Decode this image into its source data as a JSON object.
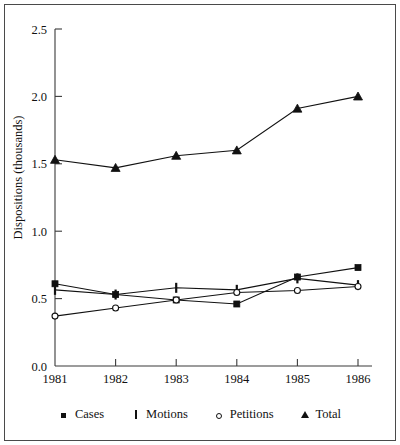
{
  "chart_data": {
    "type": "line",
    "title": "",
    "xlabel": "",
    "ylabel": "Dispositions (thousands)",
    "categories": [
      "1981",
      "1982",
      "1983",
      "1984",
      "1985",
      "1986"
    ],
    "x": [
      1981,
      1982,
      1983,
      1984,
      1985,
      1986
    ],
    "ylim": [
      0.0,
      2.5
    ],
    "yticks": [
      "0.0",
      "0.5",
      "1.0",
      "1.5",
      "2.0",
      "2.5"
    ],
    "ytick_values": [
      0.0,
      0.5,
      1.0,
      1.5,
      2.0,
      2.5
    ],
    "grid": false,
    "legend_position": "bottom",
    "series": [
      {
        "name": "Cases",
        "marker": "filled-square",
        "values": [
          0.61,
          0.53,
          0.49,
          0.46,
          0.66,
          0.73
        ]
      },
      {
        "name": "Motions",
        "marker": "vertical-bar",
        "values": [
          0.565,
          0.53,
          0.58,
          0.565,
          0.65,
          0.6
        ]
      },
      {
        "name": "Petitions",
        "marker": "open-circle",
        "values": [
          0.37,
          0.43,
          0.49,
          0.545,
          0.56,
          0.59
        ]
      },
      {
        "name": "Total",
        "marker": "filled-triangle",
        "values": [
          1.53,
          1.47,
          1.56,
          1.6,
          1.91,
          2.0
        ]
      }
    ]
  },
  "legend": {
    "items": [
      {
        "label": "Cases",
        "marker": "filled-square-icon"
      },
      {
        "label": "Motions",
        "marker": "vertical-bar-icon"
      },
      {
        "label": "Petitions",
        "marker": "open-circle-icon"
      },
      {
        "label": "Total",
        "marker": "filled-triangle-icon"
      }
    ]
  }
}
